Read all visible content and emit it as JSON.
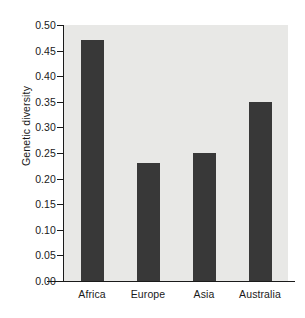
{
  "chart_data": {
    "type": "bar",
    "title": "",
    "xlabel": "",
    "ylabel": "Genetic diversity",
    "categories": [
      "Africa",
      "Europe",
      "Asia",
      "Australia"
    ],
    "values": [
      0.47,
      0.23,
      0.25,
      0.35
    ],
    "ylim": [
      0.0,
      0.5
    ],
    "ytick_values": [
      0.0,
      0.05,
      0.1,
      0.15,
      0.2,
      0.25,
      0.3,
      0.35,
      0.4,
      0.45,
      0.5
    ],
    "ytick_labels": [
      "0.00",
      "0.05",
      "0.10",
      "0.15",
      "0.20",
      "0.25",
      "0.30",
      "0.35",
      "0.40",
      "0.45",
      "0.50"
    ],
    "grid": false,
    "legend": null,
    "bar_color": "#383838",
    "plot_background": "#e8e8e6",
    "figure_background": "#ffffff",
    "axis_color": "#1a1a1a"
  }
}
